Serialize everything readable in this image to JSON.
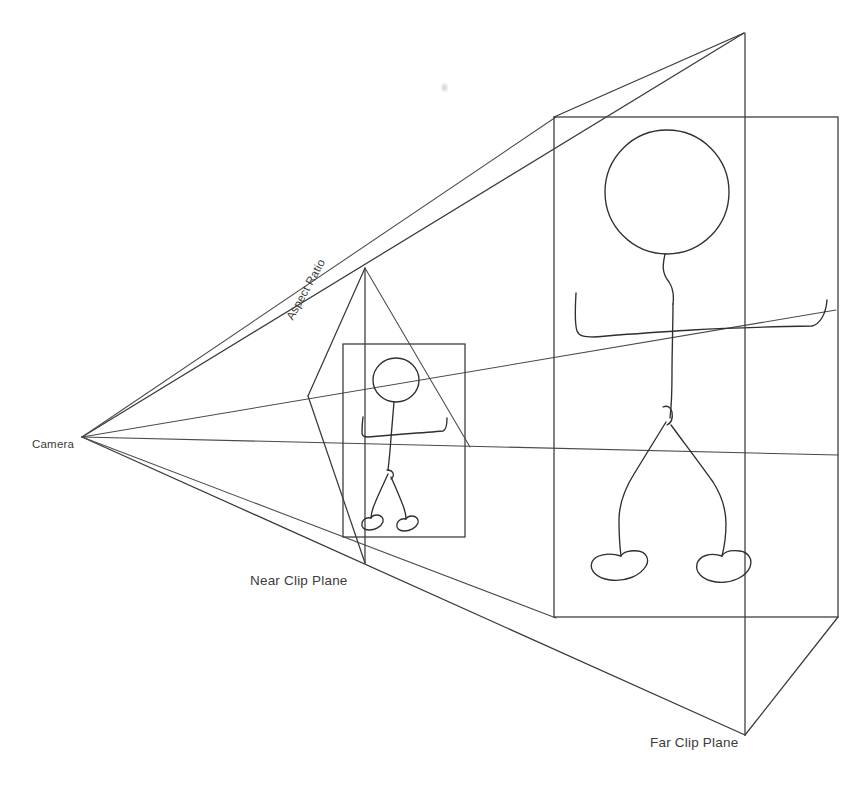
{
  "diagram": {
    "type": "hand-drawn perspective frustum illustration",
    "background_color": "#ffffff",
    "line_color": "#3a3a3a",
    "labels": {
      "camera": "Camera",
      "aspect_ratio": "Aspect Ratio",
      "near_clip_plane": "Near Clip Plane",
      "far_clip_plane": "Far Clip Plane"
    },
    "geometry": {
      "camera_apex": [
        82,
        437
      ],
      "near_plane_quad": [
        [
          365,
          268
        ],
        [
          308,
          396
        ],
        [
          365,
          563
        ],
        [
          472,
          447
        ]
      ],
      "far_plane_quad": [
        [
          745,
          33
        ],
        [
          554,
          117
        ],
        [
          745,
          735
        ],
        [
          838,
          617
        ]
      ],
      "near_rect": {
        "x": 343,
        "y": 344,
        "width": 122,
        "height": 193
      },
      "far_rect": {
        "x": 554,
        "y": 117,
        "width": 284,
        "height": 500
      },
      "near_vertical_line": {
        "x": 365,
        "y1": 268,
        "y2": 563
      },
      "far_vertical_line": {
        "x": 745,
        "y1": 33,
        "y2": 735
      }
    },
    "figures": [
      {
        "name": "near-stick-figure",
        "scale": "small",
        "position": "near clip plane"
      },
      {
        "name": "far-stick-figure",
        "scale": "large",
        "position": "far clip plane"
      }
    ]
  }
}
